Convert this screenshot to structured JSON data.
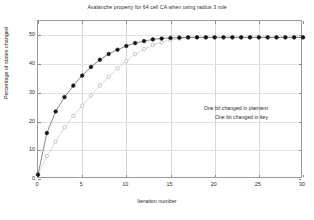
{
  "chart_data": {
    "type": "line",
    "title": "Avalanche property for 64 cell CA when using radius 3 rule",
    "xlabel": "Iteration number",
    "ylabel": "Percentage of states changed",
    "xlim": [
      0,
      30
    ],
    "ylim": [
      0,
      55
    ],
    "xticks": [
      0,
      5,
      10,
      15,
      20,
      25,
      30
    ],
    "yticks": [
      0,
      10,
      20,
      30,
      40,
      50
    ],
    "grid": true,
    "legend_position": "center-right",
    "x": [
      0,
      1,
      2,
      3,
      4,
      5,
      6,
      7,
      8,
      9,
      10,
      11,
      12,
      13,
      14,
      15,
      16,
      17,
      18,
      19,
      20,
      21,
      22,
      23,
      24,
      25,
      26,
      27,
      28,
      29,
      30
    ],
    "series": [
      {
        "name": "One bit changed in plaintext",
        "marker": "open-circle",
        "color": "#b9b9b9",
        "values": [
          1.6,
          8.0,
          13.0,
          18.0,
          22.0,
          25.5,
          29.0,
          32.5,
          35.5,
          38.5,
          41.0,
          43.5,
          45.2,
          46.6,
          47.6,
          48.4,
          48.9,
          49.2,
          49.3,
          49.3,
          49.3,
          49.3,
          49.3,
          49.3,
          49.3,
          49.3,
          49.3,
          49.3,
          49.3,
          49.3,
          49.3
        ]
      },
      {
        "name": "One bit changed in key",
        "marker": "filled-circle",
        "color": "#1a1a1a",
        "values": [
          1.5,
          16.0,
          23.5,
          28.5,
          32.5,
          36.0,
          39.0,
          41.5,
          43.5,
          45.0,
          46.3,
          47.3,
          48.0,
          48.6,
          48.9,
          49.1,
          49.2,
          49.3,
          49.3,
          49.3,
          49.3,
          49.3,
          49.3,
          49.3,
          49.3,
          49.3,
          49.3,
          49.3,
          49.3,
          49.3,
          49.3
        ]
      }
    ]
  },
  "legend": {
    "entries": [
      {
        "label": "One bit changed in plaintext"
      },
      {
        "label": "One bit changed in key"
      }
    ]
  }
}
